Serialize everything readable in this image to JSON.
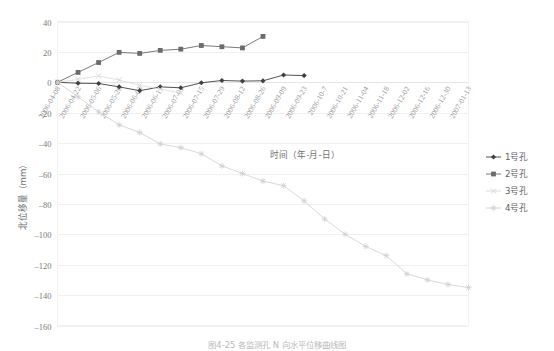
{
  "chart_data": {
    "type": "line",
    "title": "",
    "xlabel": "时间（年-月-日）",
    "ylabel": "北位移量（mm）",
    "ylim": [
      -160,
      40
    ],
    "ytick_step": 20,
    "yticks": [
      "40",
      "20",
      "0",
      "-20",
      "-40",
      "-60",
      "-80",
      "-100",
      "-120",
      "-140",
      "-160"
    ],
    "grid": true,
    "legend_position": "right",
    "categories": [
      "2006-04-08",
      "2006-04-22",
      "2006-05-06",
      "2006-05-20",
      "2006-06-03",
      "2006-06-17",
      "2006-07-01",
      "2006-07-15",
      "2006-07-29",
      "2006-08-12",
      "2006-08-26",
      "2006-09-09",
      "2006-09-23",
      "2006-10-7",
      "2006-10-21",
      "2006-11-04",
      "2006-11-18",
      "2006-12-02",
      "2006-12-16",
      "2006-12-30",
      "2007-01-13"
    ],
    "series": [
      {
        "name": "1号孔",
        "color": "#404040",
        "marker": "diamond",
        "values": [
          0,
          -0.6,
          -0.8,
          -3.0,
          -5.5,
          -3.0,
          -3.6,
          -0.3,
          1.2,
          0.8,
          1.0,
          4.8,
          4.4,
          null,
          null,
          null,
          null,
          null,
          null,
          null,
          null
        ]
      },
      {
        "name": "2号孔",
        "color": "#6b6b6b",
        "marker": "square",
        "values": [
          0,
          6.5,
          13.0,
          19.7,
          19.0,
          21.0,
          21.8,
          24.2,
          23.4,
          22.6,
          30.2,
          null,
          null,
          null,
          null,
          null,
          null,
          null,
          null,
          null,
          null
        ]
      },
      {
        "name": "3号孔",
        "color": "#d9d9d9",
        "marker": "cross",
        "values": [
          0,
          2.0,
          4.2,
          1.5,
          -2.0,
          -4.5,
          -7.0,
          null,
          null,
          null,
          null,
          null,
          null,
          null,
          null,
          null,
          null,
          null,
          null,
          null,
          null
        ]
      },
      {
        "name": "4号孔",
        "color": "#cfcfcf",
        "marker": "star",
        "values": [
          0,
          -9.5,
          -19.5,
          -28.0,
          -33.0,
          -40.5,
          -43.0,
          -47.0,
          -55.0,
          -60.0,
          -65.0,
          -68.0,
          -78.0,
          -90.0,
          -100.0,
          -108.0,
          -114.0,
          -126.0,
          -130.0,
          -133.0,
          -135.0
        ]
      }
    ]
  },
  "legend": {
    "items": [
      {
        "label": "1号孔"
      },
      {
        "label": "2号孔"
      },
      {
        "label": "3号孔"
      },
      {
        "label": "4号孔"
      }
    ]
  },
  "caption": {
    "text": "图4-25  各监测孔 N 向水平位移曲线图"
  }
}
